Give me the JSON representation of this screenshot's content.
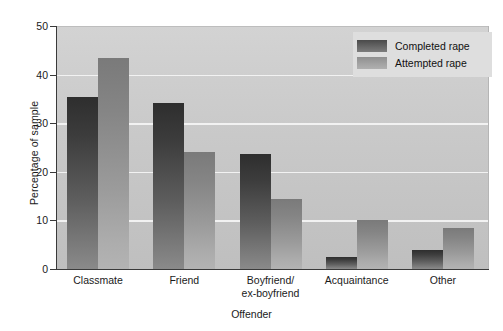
{
  "chart_data": {
    "type": "bar",
    "title": "",
    "xlabel": "Offender",
    "ylabel": "Percentage of sample",
    "ylim": [
      0,
      50
    ],
    "yticks": [
      0,
      10,
      20,
      30,
      40,
      50
    ],
    "ytick_labels": [
      "0",
      "10",
      "20",
      "30",
      "40",
      "50"
    ],
    "grid": true,
    "gridlines_at": [
      10,
      20,
      30,
      40
    ],
    "legend_position": "top-right",
    "categories": [
      "Classmate",
      "Friend",
      "Boyfriend/ex-boyfriend",
      "Acquaintance",
      "Other"
    ],
    "category_lines": [
      [
        "Classmate"
      ],
      [
        "Friend"
      ],
      [
        "Boyfriend/",
        "ex-boyfriend"
      ],
      [
        "Acquaintance"
      ],
      [
        "Other"
      ]
    ],
    "series": [
      {
        "name": "Completed rape",
        "color": "#3c3c3c",
        "values": [
          35.4,
          34.2,
          23.7,
          2.5,
          4.0
        ]
      },
      {
        "name": "Attempted rape",
        "color": "#9b9b9b",
        "values": [
          43.4,
          24.0,
          14.5,
          10.0,
          8.5
        ]
      }
    ]
  },
  "legend": {
    "items": [
      {
        "label": "Completed rape",
        "swatch": "completed"
      },
      {
        "label": "Attempted rape",
        "swatch": "attempted"
      }
    ]
  },
  "colors": {
    "plot_background": "#c9c9c9",
    "gridline": "#f2f2f2",
    "axis": "#3a3a3a",
    "legend_background": "#dedede",
    "completed_bar": "#3c3c3c",
    "attempted_bar": "#9b9b9b"
  }
}
